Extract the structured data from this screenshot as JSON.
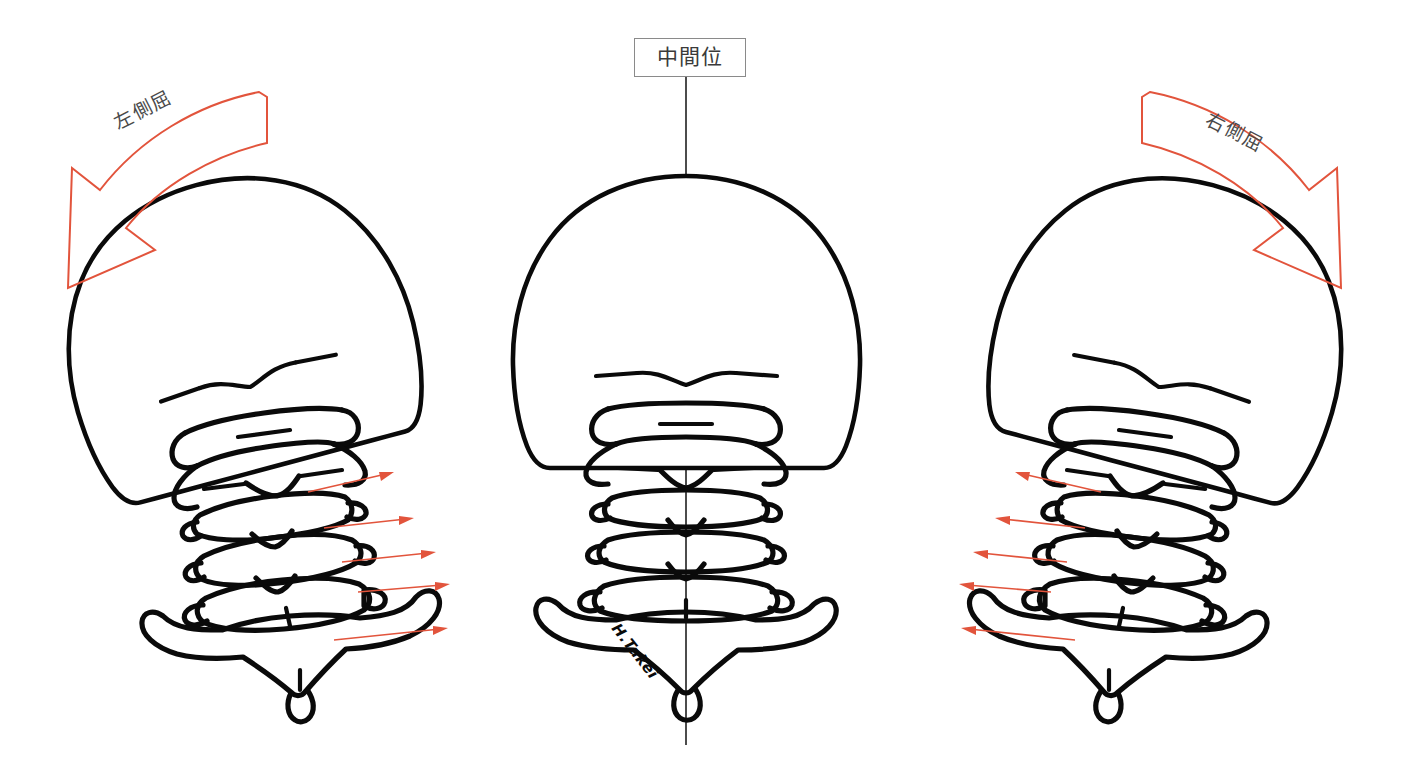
{
  "figure": {
    "title_neutral": "中間位",
    "label_left_flexion": "左側屈",
    "label_right_flexion": "右側屈",
    "signature": "H.Takei",
    "background_color": "#ffffff",
    "bone_color": "#0a0a0a",
    "arrow_color": "#e2543c",
    "label_text_color": "#4a4a4a",
    "box_border_color": "#8a8a8a"
  },
  "panels": [
    {
      "id": "left",
      "name": "left-lateral-flexion",
      "label": "左側屈",
      "tilt_degrees": -15,
      "arrow_direction": "right",
      "pointer_count": 5
    },
    {
      "id": "center",
      "name": "neutral-position",
      "label": "中間位",
      "tilt_degrees": 0,
      "arrow_direction": "none",
      "pointer_count": 0
    },
    {
      "id": "right",
      "name": "right-lateral-flexion",
      "label": "右側屈",
      "tilt_degrees": 15,
      "arrow_direction": "left",
      "pointer_count": 5
    }
  ],
  "pointers": {
    "left": [
      {
        "tail_x": 308,
        "tail_y": 492,
        "tip_x": 394,
        "tip_y": 472
      },
      {
        "tail_x": 324,
        "tail_y": 528,
        "tip_x": 414,
        "tip_y": 518
      },
      {
        "tail_x": 342,
        "tail_y": 562,
        "tip_x": 436,
        "tip_y": 552
      },
      {
        "tail_x": 358,
        "tail_y": 592,
        "tip_x": 450,
        "tip_y": 584
      },
      {
        "tail_x": 334,
        "tail_y": 640,
        "tip_x": 448,
        "tip_y": 628
      }
    ],
    "right": [
      {
        "tail_x": 1101,
        "tail_y": 492,
        "tip_x": 1015,
        "tip_y": 472
      },
      {
        "tail_x": 1085,
        "tail_y": 528,
        "tip_x": 995,
        "tip_y": 518
      },
      {
        "tail_x": 1067,
        "tail_y": 562,
        "tip_x": 973,
        "tip_y": 552
      },
      {
        "tail_x": 1051,
        "tail_y": 592,
        "tip_x": 959,
        "tip_y": 584
      },
      {
        "tail_x": 1075,
        "tail_y": 640,
        "tip_x": 961,
        "tip_y": 628
      }
    ]
  }
}
